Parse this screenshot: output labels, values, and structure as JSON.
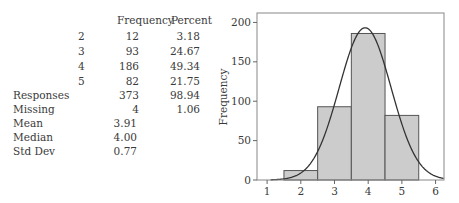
{
  "table": {
    "headers": [
      "Frequency",
      "Percent"
    ],
    "rows": [
      {
        "label": "2",
        "frequency": "12",
        "percent": "3.18"
      },
      {
        "label": "3",
        "frequency": "93",
        "percent": "24.67"
      },
      {
        "label": "4",
        "frequency": "186",
        "percent": "49.34"
      },
      {
        "label": "5",
        "frequency": "82",
        "percent": "21.75"
      }
    ],
    "summary": [
      {
        "label": "Responses",
        "frequency": "373",
        "percent": "98.94"
      },
      {
        "label": "Missing",
        "frequency": "4",
        "percent": "1.06"
      }
    ],
    "stats": [
      {
        "label": "Mean",
        "value": "3.91"
      },
      {
        "label": "Median",
        "value": "4.00"
      },
      {
        "label": "Std Dev",
        "value": "0.77"
      }
    ]
  },
  "chart_data": {
    "type": "bar",
    "subtype": "histogram-with-normal-curve",
    "title": "",
    "xlabel": "",
    "ylabel": "Frequency",
    "categories": [
      "2",
      "3",
      "4",
      "5"
    ],
    "bin_edges": [
      1.5,
      2.5,
      3.5,
      4.5,
      5.5
    ],
    "values": [
      12,
      93,
      186,
      82
    ],
    "normal_curve": {
      "mean": 3.91,
      "std": 0.77,
      "n": 373
    },
    "xlim": [
      0.7,
      6.25
    ],
    "ylim": [
      0,
      212
    ],
    "x_ticks": [
      "1",
      "2",
      "3",
      "4",
      "5",
      "6"
    ],
    "y_ticks": [
      "0",
      "50",
      "100",
      "150",
      "200"
    ],
    "grid": false,
    "legend": "none",
    "bar_color": "#cccccc",
    "curve_color": "#333333"
  }
}
